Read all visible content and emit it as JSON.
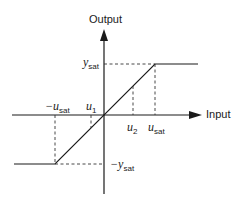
{
  "diagram": {
    "axes": {
      "y_label": "Output",
      "x_label": "Input"
    },
    "labels": {
      "y_sat": {
        "var": "y",
        "sub": "sat",
        "prefix": ""
      },
      "neg_y_sat": {
        "var": "y",
        "sub": "sat",
        "prefix": "−"
      },
      "neg_u_sat": {
        "var": "u",
        "sub": "sat",
        "prefix": "−"
      },
      "u_sat": {
        "var": "u",
        "sub": "sat",
        "prefix": ""
      },
      "u1": {
        "var": "u",
        "sub": "1",
        "prefix": ""
      },
      "u2": {
        "var": "u",
        "sub": "2",
        "prefix": ""
      }
    },
    "colors": {
      "line": "#1a1a1a",
      "dashed": "#333333",
      "background": "#ffffff"
    }
  }
}
